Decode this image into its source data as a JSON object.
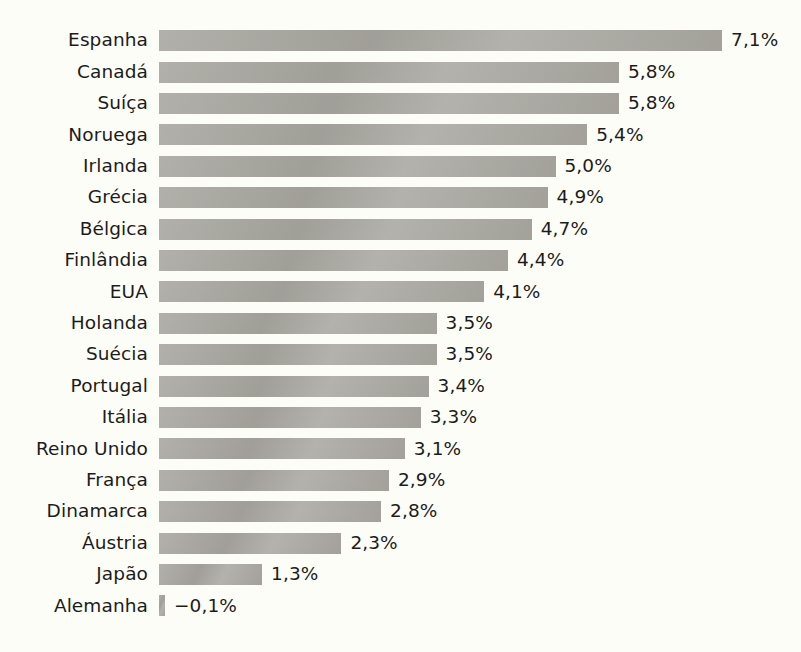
{
  "chart_data": {
    "type": "bar",
    "orientation": "horizontal",
    "title": "",
    "subtitle": "",
    "xlabel": "",
    "ylabel": "",
    "grid": false,
    "legend": false,
    "value_suffix": "%",
    "decimal_separator": ",",
    "xlim": [
      -0.1,
      7.1
    ],
    "categories": [
      "Espanha",
      "Canadá",
      "Suíça",
      "Noruega",
      "Irlanda",
      "Grécia",
      "Bélgica",
      "Finlândia",
      "EUA",
      "Holanda",
      "Suécia",
      "Portugal",
      "Itália",
      "Reino Unido",
      "França",
      "Dinamarca",
      "Áustria",
      "Japão",
      "Alemanha"
    ],
    "values": [
      7.1,
      5.8,
      5.8,
      5.4,
      5.0,
      4.9,
      4.7,
      4.4,
      4.1,
      3.5,
      3.5,
      3.4,
      3.3,
      3.1,
      2.9,
      2.8,
      2.3,
      1.3,
      -0.1
    ],
    "value_labels": [
      "7,1%",
      "5,8%",
      "5,8%",
      "5,4%",
      "5,0%",
      "4,9%",
      "4,7%",
      "4,4%",
      "4,1%",
      "3,5%",
      "3,5%",
      "3,4%",
      "3,3%",
      "3,1%",
      "2,9%",
      "2,8%",
      "2,3%",
      "1,3%",
      "−0,1%"
    ],
    "colors": {
      "bar": "#a9a7a0",
      "background": "#fdfdf8",
      "text": "#1c1c1a"
    }
  }
}
